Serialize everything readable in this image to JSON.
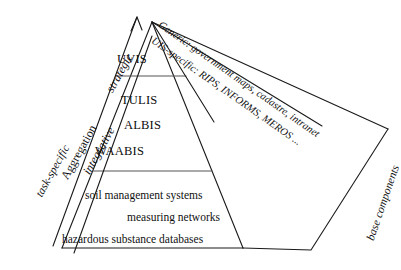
{
  "diagram": {
    "type": "pyramid-hierarchy",
    "background_color": "#ffffff",
    "line_color": "#1a1a1a",
    "text_color": "#111111",
    "pyramid": {
      "tiers": [
        {
          "level": "top",
          "items": [
            {
              "label": "UVIS"
            }
          ]
        },
        {
          "level": "middle",
          "items": [
            {
              "label": "TULIS"
            },
            {
              "label": "ALBIS"
            },
            {
              "label": "WAABIS"
            }
          ]
        },
        {
          "level": "bottom",
          "items": [
            {
              "label": "soil management systems"
            },
            {
              "label": "measuring networks"
            },
            {
              "label": "hazardous substance databases"
            }
          ]
        }
      ]
    },
    "left_axis": {
      "arrow_label": "Aggregation",
      "scale_labels": [
        {
          "label": "task-specific",
          "style": "italic"
        },
        {
          "label": "integrative",
          "style": "italic"
        },
        {
          "label": "strategic",
          "style": "italic"
        }
      ]
    },
    "right_annotations": [
      {
        "label": "Generic: government maps, cadastre, intranet",
        "style": "italic"
      },
      {
        "label": "UIS-specific:  RIPS, INFORMS, MEROS ...",
        "style": "italic"
      },
      {
        "label": "base components",
        "style": "italic"
      }
    ]
  }
}
